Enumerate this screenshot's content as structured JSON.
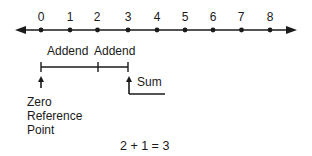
{
  "number_line": {
    "ticks": [
      "0",
      "1",
      "2",
      "3",
      "4",
      "5",
      "6",
      "7",
      "8"
    ]
  },
  "labels": {
    "addend_1": "Addend",
    "addend_2": "Addend",
    "sum": "Sum",
    "zero_ref_line1": "Zero",
    "zero_ref_line2": "Reference",
    "zero_ref_line3": "Point",
    "equation": "2 + 1 = 3"
  }
}
